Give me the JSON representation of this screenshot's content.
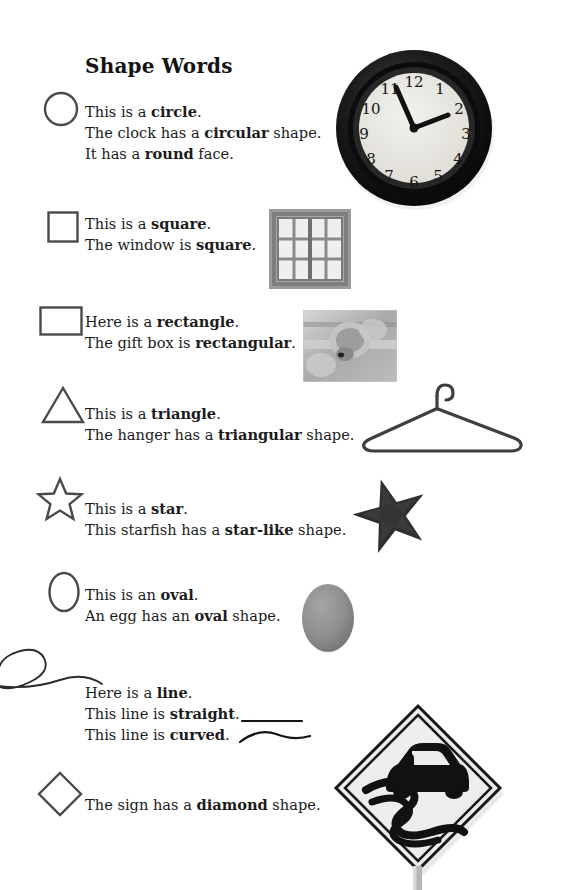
{
  "document": {
    "title": "Shape Words",
    "background_color": "#ffffff",
    "text_color": "#1b1b1b"
  },
  "entries": [
    {
      "shape": "circle",
      "icon_name": "circle-outline-icon",
      "lines": [
        [
          {
            "t": "This is a ",
            "b": false
          },
          {
            "t": "circle",
            "b": true
          },
          {
            "t": ".",
            "b": false
          }
        ],
        [
          {
            "t": "The clock has a ",
            "b": false
          },
          {
            "t": "circular",
            "b": true
          },
          {
            "t": " shape.",
            "b": false
          }
        ],
        [
          {
            "t": "It has a ",
            "b": false
          },
          {
            "t": "round",
            "b": true
          },
          {
            "t": " face.",
            "b": false
          }
        ]
      ],
      "picture": "wall-clock-photo"
    },
    {
      "shape": "square",
      "icon_name": "square-outline-icon",
      "lines": [
        [
          {
            "t": "This is a ",
            "b": false
          },
          {
            "t": "square",
            "b": true
          },
          {
            "t": ".",
            "b": false
          }
        ],
        [
          {
            "t": "The window is ",
            "b": false
          },
          {
            "t": "square",
            "b": true
          },
          {
            "t": ".",
            "b": false
          }
        ]
      ],
      "picture": "window-photo"
    },
    {
      "shape": "rectangle",
      "icon_name": "rectangle-outline-icon",
      "lines": [
        [
          {
            "t": "Here is a ",
            "b": false
          },
          {
            "t": "rectangle",
            "b": true
          },
          {
            "t": ".",
            "b": false
          }
        ],
        [
          {
            "t": "The gift box is ",
            "b": false
          },
          {
            "t": "rectangular",
            "b": true
          },
          {
            "t": ".",
            "b": false
          }
        ]
      ],
      "picture": "gift-box-photo"
    },
    {
      "shape": "triangle",
      "icon_name": "triangle-outline-icon",
      "lines": [
        [
          {
            "t": "This is a ",
            "b": false
          },
          {
            "t": "triangle",
            "b": true
          },
          {
            "t": ".",
            "b": false
          }
        ],
        [
          {
            "t": "The hanger has a ",
            "b": false
          },
          {
            "t": "triangular",
            "b": true
          },
          {
            "t": " shape.",
            "b": false
          }
        ]
      ],
      "picture": "clothes-hanger-photo"
    },
    {
      "shape": "star",
      "icon_name": "star-outline-icon",
      "lines": [
        [
          {
            "t": "This is a ",
            "b": false
          },
          {
            "t": "star",
            "b": true
          },
          {
            "t": ".",
            "b": false
          }
        ],
        [
          {
            "t": "This starfish has a ",
            "b": false
          },
          {
            "t": "star-like",
            "b": true
          },
          {
            "t": " shape.",
            "b": false
          }
        ]
      ],
      "picture": "starfish-photo"
    },
    {
      "shape": "oval",
      "icon_name": "oval-outline-icon",
      "lines": [
        [
          {
            "t": "This is an ",
            "b": false
          },
          {
            "t": "oval",
            "b": true
          },
          {
            "t": ".",
            "b": false
          }
        ],
        [
          {
            "t": "An egg has an ",
            "b": false
          },
          {
            "t": "oval",
            "b": true
          },
          {
            "t": " shape.",
            "b": false
          }
        ]
      ],
      "picture": "egg-photo"
    },
    {
      "shape": "line",
      "icon_name": "curly-line-icon",
      "lines": [
        [
          {
            "t": "Here is a ",
            "b": false
          },
          {
            "t": "line",
            "b": true
          },
          {
            "t": ".",
            "b": false
          }
        ],
        [
          {
            "t": "This line is ",
            "b": false
          },
          {
            "t": "straight",
            "b": true
          },
          {
            "t": ".",
            "b": false
          }
        ],
        [
          {
            "t": "This line is ",
            "b": false
          },
          {
            "t": "curved",
            "b": true
          },
          {
            "t": ".",
            "b": false
          }
        ]
      ],
      "picture": "line-samples"
    },
    {
      "shape": "diamond",
      "icon_name": "diamond-outline-icon",
      "lines": [
        [
          {
            "t": "The sign has a ",
            "b": false
          },
          {
            "t": "diamond",
            "b": true
          },
          {
            "t": " shape.",
            "b": false
          }
        ]
      ],
      "picture": "slippery-road-sign-photo"
    }
  ],
  "clock": {
    "numerals": [
      "12",
      "1",
      "2",
      "3",
      "4",
      "5",
      "6",
      "7",
      "8",
      "9",
      "10",
      "11"
    ],
    "bezel_color": "#141414",
    "face_color": "#eceae6",
    "hand_color": "#111111"
  },
  "window": {
    "frame_color": "#8c8c8c",
    "pane_color": "#f3f3f3",
    "panes_across": 4,
    "panes_down": 3
  },
  "gift_box": {
    "tone_color": "#b4b4b4"
  },
  "hanger": {
    "wire_color": "#3d3d3d"
  },
  "starfish": {
    "body_color": "#2e2e2e"
  },
  "egg": {
    "shell_color": "#8f8f8f"
  },
  "road_sign": {
    "sign_face_color": "#ececec",
    "sign_border_color": "#1a1a1a",
    "car_color": "#111111",
    "post_color": "#b8b8b8"
  },
  "shape_icons": {
    "stroke_color": "#4a4a4a",
    "stroke_width": 2.4
  }
}
